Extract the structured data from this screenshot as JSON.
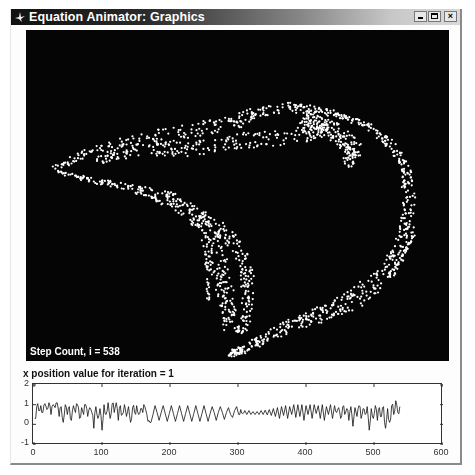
{
  "window": {
    "title": "Equation Animator: Graphics",
    "controls": {
      "minimize": "_",
      "maximize": "□",
      "close": "×"
    }
  },
  "main_plot": {
    "background": "#050505",
    "point_color": "#ffffff",
    "step_label": "Step Count, i = 538",
    "step_count": 538
  },
  "sub_plot": {
    "title": "x position value for iteration = 1"
  },
  "chart_data": {
    "type": "line",
    "title": "x position value for iteration = 1",
    "xlabel": "",
    "ylabel": "",
    "xlim": [
      0,
      600
    ],
    "ylim": [
      -1,
      2
    ],
    "xticks": [
      "0",
      "100",
      "200",
      "300",
      "400",
      "500",
      "600"
    ],
    "yticks": [
      "2",
      "1",
      "0",
      "-1"
    ],
    "grid": false,
    "line_color": "#111111",
    "series": [
      {
        "name": "x position",
        "x_range": [
          1,
          538
        ],
        "points": [
          [
            1,
            0.3
          ],
          [
            4,
            0.9
          ],
          [
            7,
            0.7
          ],
          [
            10,
            0.95
          ],
          [
            13,
            0.6
          ],
          [
            16,
            1.05
          ],
          [
            19,
            0.75
          ],
          [
            22,
            1.1
          ],
          [
            25,
            0.5
          ],
          [
            28,
            1.0
          ],
          [
            31,
            0.85
          ],
          [
            34,
            1.1
          ],
          [
            37,
            0.4
          ],
          [
            40,
            0.9
          ],
          [
            43,
            0.1
          ],
          [
            46,
            1.0
          ],
          [
            49,
            0.5
          ],
          [
            52,
            0.9
          ],
          [
            55,
            0.2
          ],
          [
            58,
            0.95
          ],
          [
            61,
            0.6
          ],
          [
            64,
            1.0
          ],
          [
            67,
            0.3
          ],
          [
            70,
            0.85
          ],
          [
            73,
            0.5
          ],
          [
            76,
            1.0
          ],
          [
            79,
            0.4
          ],
          [
            82,
            0.85
          ],
          [
            85,
            0.6
          ],
          [
            88,
            -0.2
          ],
          [
            91,
            0.9
          ],
          [
            94,
            0.3
          ],
          [
            97,
            0.8
          ],
          [
            100,
            -0.3
          ],
          [
            103,
            1.0
          ],
          [
            106,
            0.5
          ],
          [
            109,
            1.1
          ],
          [
            112,
            0.3
          ],
          [
            115,
            1.05
          ],
          [
            118,
            0.6
          ],
          [
            121,
            1.1
          ],
          [
            124,
            0.2
          ],
          [
            127,
            0.95
          ],
          [
            130,
            0.5
          ],
          [
            133,
            1.0
          ],
          [
            136,
            0.4
          ],
          [
            139,
            0.9
          ],
          [
            142,
            0.1
          ],
          [
            145,
            0.85
          ],
          [
            148,
            0.6
          ],
          [
            151,
            0.95
          ],
          [
            154,
            0.5
          ],
          [
            157,
            0.8
          ],
          [
            160,
            0.6
          ],
          [
            163,
            0.9
          ],
          [
            166,
            0.5
          ],
          [
            169,
            0.2
          ],
          [
            172,
            0.1
          ],
          [
            175,
            0.5
          ],
          [
            178,
            0.95
          ],
          [
            181,
            0.6
          ],
          [
            184,
            0.2
          ],
          [
            187,
            0.6
          ],
          [
            190,
            0.95
          ],
          [
            193,
            0.55
          ],
          [
            196,
            0.15
          ],
          [
            199,
            0.55
          ],
          [
            202,
            0.95
          ],
          [
            205,
            0.55
          ],
          [
            208,
            0.15
          ],
          [
            211,
            0.55
          ],
          [
            214,
            0.95
          ],
          [
            217,
            0.55
          ],
          [
            220,
            0.15
          ],
          [
            223,
            0.55
          ],
          [
            226,
            0.95
          ],
          [
            229,
            0.55
          ],
          [
            232,
            0.15
          ],
          [
            235,
            0.55
          ],
          [
            238,
            0.95
          ],
          [
            241,
            0.55
          ],
          [
            244,
            0.15
          ],
          [
            247,
            0.55
          ],
          [
            250,
            0.95
          ],
          [
            253,
            0.55
          ],
          [
            256,
            0.15
          ],
          [
            259,
            0.55
          ],
          [
            262,
            0.9
          ],
          [
            265,
            0.6
          ],
          [
            268,
            0.2
          ],
          [
            271,
            0.6
          ],
          [
            274,
            0.9
          ],
          [
            277,
            0.6
          ],
          [
            280,
            0.25
          ],
          [
            283,
            0.6
          ],
          [
            286,
            0.85
          ],
          [
            289,
            0.5
          ],
          [
            292,
            0.35
          ],
          [
            295,
            0.7
          ],
          [
            298,
            0.9
          ],
          [
            301,
            0.5
          ],
          [
            304,
            0.75
          ],
          [
            307,
            0.55
          ],
          [
            310,
            0.7
          ],
          [
            313,
            0.5
          ],
          [
            316,
            0.7
          ],
          [
            319,
            0.5
          ],
          [
            322,
            0.65
          ],
          [
            325,
            0.5
          ],
          [
            328,
            0.65
          ],
          [
            331,
            0.5
          ],
          [
            334,
            0.7
          ],
          [
            337,
            0.5
          ],
          [
            340,
            0.72
          ],
          [
            343,
            0.48
          ],
          [
            346,
            0.75
          ],
          [
            349,
            0.45
          ],
          [
            352,
            0.8
          ],
          [
            355,
            0.4
          ],
          [
            358,
            0.85
          ],
          [
            361,
            0.3
          ],
          [
            364,
            0.9
          ],
          [
            367,
            0.45
          ],
          [
            370,
            0.95
          ],
          [
            373,
            0.3
          ],
          [
            376,
            0.9
          ],
          [
            379,
            0.5
          ],
          [
            382,
            1.0
          ],
          [
            385,
            0.35
          ],
          [
            388,
            1.0
          ],
          [
            391,
            0.4
          ],
          [
            394,
            1.0
          ],
          [
            397,
            0.2
          ],
          [
            400,
            0.95
          ],
          [
            403,
            0.5
          ],
          [
            406,
            1.0
          ],
          [
            409,
            0.3
          ],
          [
            412,
            1.0
          ],
          [
            415,
            0.55
          ],
          [
            418,
            0.95
          ],
          [
            421,
            0.3
          ],
          [
            424,
            1.0
          ],
          [
            427,
            0.2
          ],
          [
            430,
            0.9
          ],
          [
            433,
            0.5
          ],
          [
            436,
            1.0
          ],
          [
            439,
            0.3
          ],
          [
            442,
            0.95
          ],
          [
            445,
            0.6
          ],
          [
            448,
            0.85
          ],
          [
            451,
            0.3
          ],
          [
            454,
            0.9
          ],
          [
            457,
            0.5
          ],
          [
            460,
            0.8
          ],
          [
            463,
            0.2
          ],
          [
            466,
            0.9
          ],
          [
            469,
            -0.1
          ],
          [
            472,
            0.85
          ],
          [
            475,
            0.4
          ],
          [
            478,
            0.95
          ],
          [
            481,
            0.3
          ],
          [
            484,
            0.8
          ],
          [
            487,
            0.5
          ],
          [
            490,
            0.9
          ],
          [
            493,
            -0.3
          ],
          [
            496,
            0.8
          ],
          [
            499,
            0.3
          ],
          [
            502,
            0.95
          ],
          [
            505,
            0.2
          ],
          [
            508,
            0.85
          ],
          [
            511,
            0.4
          ],
          [
            514,
            0.9
          ],
          [
            517,
            -0.2
          ],
          [
            520,
            0.8
          ],
          [
            523,
            0.1
          ],
          [
            526,
            0.95
          ],
          [
            529,
            0.5
          ],
          [
            532,
            1.2
          ],
          [
            535,
            0.6
          ],
          [
            538,
            0.9
          ]
        ]
      }
    ]
  }
}
